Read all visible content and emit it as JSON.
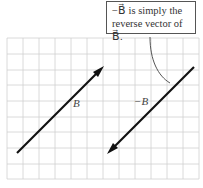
{
  "callout": {
    "line1": "−B⃗ is simply the",
    "line2": "reverse vector of B⃗."
  },
  "labels": {
    "b": "B⃗",
    "neg_b": "−B⃗"
  },
  "colors": {
    "grid": "#cfcfcf",
    "vector": "#111111",
    "leader": "#555555"
  },
  "grid": {
    "x0": 7,
    "y0": 38,
    "cell": 16,
    "cols": 12,
    "rows": 9
  }
}
